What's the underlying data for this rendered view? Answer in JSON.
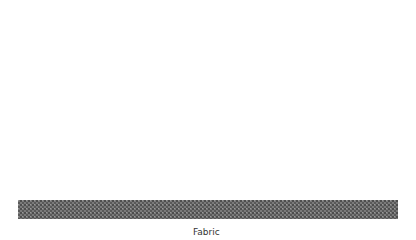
{
  "diagram": {
    "title": "",
    "labels": {
      "fabric": "Fabric"
    },
    "elements": {
      "free_micelle": "Surfactant molecules surrounding dirt particle (micelle)",
      "adsorbed_micelle": "Surfactant molecules surrounding dirt on fabric surface",
      "fabric_layer": "Fabric"
    },
    "colors": {
      "dirt": "#1a1a1a",
      "head": "#8a8a8a",
      "tail": "#555555",
      "fabric": "#6a6a6a"
    }
  }
}
